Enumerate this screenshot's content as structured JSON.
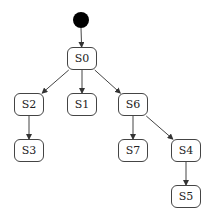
{
  "diagram": {
    "type": "state-machine-tree",
    "initial": {
      "x": 81,
      "y": 20,
      "r": 8,
      "color": "#000000"
    },
    "nodes": [
      {
        "id": "S0",
        "label": "S0",
        "x": 67,
        "y": 47,
        "w": 30,
        "h": 23
      },
      {
        "id": "S2",
        "label": "S2",
        "x": 14,
        "y": 93,
        "w": 30,
        "h": 23
      },
      {
        "id": "S1",
        "label": "S1",
        "x": 67,
        "y": 93,
        "w": 30,
        "h": 23
      },
      {
        "id": "S6",
        "label": "S6",
        "x": 118,
        "y": 93,
        "w": 30,
        "h": 23
      },
      {
        "id": "S3",
        "label": "S3",
        "x": 14,
        "y": 139,
        "w": 30,
        "h": 23
      },
      {
        "id": "S7",
        "label": "S7",
        "x": 118,
        "y": 139,
        "w": 30,
        "h": 23
      },
      {
        "id": "S4",
        "label": "S4",
        "x": 171,
        "y": 139,
        "w": 30,
        "h": 23
      },
      {
        "id": "S5",
        "label": "S5",
        "x": 171,
        "y": 185,
        "w": 30,
        "h": 23
      }
    ],
    "edges": [
      {
        "from": "initial",
        "to": "S0"
      },
      {
        "from": "S0",
        "to": "S2"
      },
      {
        "from": "S0",
        "to": "S1"
      },
      {
        "from": "S0",
        "to": "S6"
      },
      {
        "from": "S2",
        "to": "S3"
      },
      {
        "from": "S6",
        "to": "S7"
      },
      {
        "from": "S6",
        "to": "S4"
      },
      {
        "from": "S4",
        "to": "S5"
      }
    ],
    "colors": {
      "stroke": "#444444",
      "background": "#ffffff"
    }
  }
}
